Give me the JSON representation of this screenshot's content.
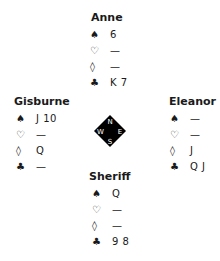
{
  "hands": {
    "north": {
      "name": "Anne",
      "spades": "6",
      "hearts": "—",
      "diamonds": "—",
      "clubs": "K 7"
    },
    "west": {
      "name": "Gisburne",
      "spades": "J 10",
      "hearts": "—",
      "diamonds": "Q",
      "clubs": "—"
    },
    "east": {
      "name": "Eleanor",
      "spades": "—",
      "hearts": "—",
      "diamonds": "J",
      "clubs": "Q J"
    },
    "south": {
      "name": "Sheriff",
      "spades": "Q",
      "hearts": "—",
      "diamonds": "—",
      "clubs": "9 8"
    }
  },
  "suits": {
    "spades": "♠",
    "hearts": "♡",
    "diamonds": "◊",
    "clubs": "♣"
  },
  "compass": {
    "n": "N",
    "e": "E",
    "s": "S",
    "w": "W"
  }
}
